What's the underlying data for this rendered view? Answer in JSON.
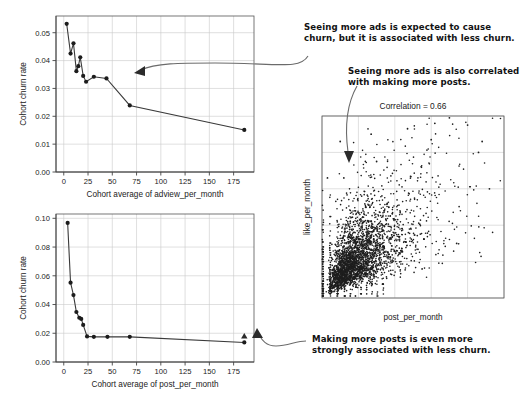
{
  "annotations": [
    {
      "name": "annotation-ads-churn",
      "line1": "Seeing more ads is expected to cause",
      "line2": "churn, but it is associated with less churn."
    },
    {
      "name": "annotation-ads-posts",
      "line1": "Seeing more ads is also correlated",
      "line2": "with making more posts."
    },
    {
      "name": "annotation-posts-churn",
      "line1": "Making more posts is even more",
      "line2": "strongly associated with less churn."
    }
  ],
  "chart_data": [
    {
      "id": "adview-churn",
      "type": "line",
      "title": "",
      "xlabel": "Cohort average of adview_per_month",
      "ylabel": "Cohort churn rate",
      "xlim": [
        -8,
        196
      ],
      "ylim": [
        0.0,
        0.056
      ],
      "xticks": [
        0,
        25,
        50,
        75,
        100,
        125,
        150,
        175
      ],
      "yticks": [
        0.0,
        0.01,
        0.02,
        0.03,
        0.04,
        0.05
      ],
      "ytick_labels": [
        "0.00",
        "0.01",
        "0.02",
        "0.03",
        "0.04",
        "0.05"
      ],
      "grid": true,
      "legend": "none",
      "x": [
        3,
        7,
        10,
        13,
        15,
        17,
        20,
        23,
        31,
        44,
        68,
        186
      ],
      "y": [
        0.0532,
        0.0425,
        0.0462,
        0.0362,
        0.038,
        0.0412,
        0.0345,
        0.0324,
        0.0342,
        0.0336,
        0.0239,
        0.0151
      ]
    },
    {
      "id": "post-churn",
      "type": "line",
      "title": "",
      "xlabel": "Cohort average of post_per_month",
      "ylabel": "Cohort churn rate",
      "xlim": [
        -8,
        196
      ],
      "ylim": [
        0.0,
        0.103
      ],
      "xticks": [
        0,
        25,
        50,
        75,
        100,
        125,
        150,
        175
      ],
      "yticks": [
        0.0,
        0.02,
        0.04,
        0.06,
        0.08,
        0.1
      ],
      "ytick_labels": [
        "0.00",
        "0.02",
        "0.04",
        "0.06",
        "0.08",
        "0.10"
      ],
      "grid": true,
      "legend": "none",
      "x": [
        4,
        7,
        10,
        13,
        16,
        18,
        20,
        24,
        31,
        45,
        68,
        186
      ],
      "y": [
        0.0968,
        0.0552,
        0.0466,
        0.0348,
        0.0308,
        0.03,
        0.0258,
        0.0178,
        0.0175,
        0.0175,
        0.0175,
        0.0136
      ]
    },
    {
      "id": "post-like-scatter",
      "type": "scatter",
      "title": "Correlation = 0.66",
      "xlabel": "post_per_month",
      "ylabel": "like_per_month",
      "xlim": [
        0,
        1
      ],
      "ylim": [
        0,
        1
      ],
      "grid": true,
      "legend": "none",
      "n_points": 2600,
      "correlation": 0.66,
      "description": "Dense positively-correlated cloud of post_per_month vs like_per_month with discrete low-value columns near the left axis."
    }
  ]
}
